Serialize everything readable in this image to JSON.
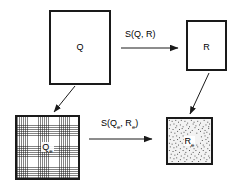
{
  "diagram": {
    "type": "commutative-square",
    "background_color": "#ffffff",
    "stroke_color": "#1a1a1a",
    "nodes": [
      {
        "id": "q",
        "label": "Q",
        "subscript": "",
        "fill": "white",
        "texture": "none",
        "position": "top-left"
      },
      {
        "id": "r",
        "label": "R",
        "subscript": "",
        "fill": "white",
        "texture": "none",
        "position": "top-right"
      },
      {
        "id": "qe",
        "label": "Q",
        "subscript": "e",
        "fill": "#ffffff",
        "texture": "fine-grid-hatch",
        "position": "bottom-left"
      },
      {
        "id": "re",
        "label": "R",
        "subscript": "e",
        "fill": "#f2f2f2",
        "texture": "stipple-noise",
        "position": "bottom-right"
      }
    ],
    "edges": [
      {
        "id": "top-arrow",
        "from": "q",
        "to": "r",
        "label": "S(Q, R)",
        "style": "horizontal-arrow"
      },
      {
        "id": "bottom-arrow",
        "from": "qe",
        "to": "re",
        "label": "S(Qe, Re)",
        "label_base_1": "S(Q",
        "label_sub_1": "e",
        "label_mid": ", R",
        "label_sub_2": "e",
        "label_end": ")",
        "style": "horizontal-arrow"
      },
      {
        "id": "left-diagonal-arrow",
        "from": "q",
        "to": "qe",
        "label": "",
        "style": "diagonal-arrow"
      },
      {
        "id": "right-diagonal-arrow",
        "from": "r",
        "to": "re",
        "label": "",
        "style": "diagonal-arrow"
      }
    ]
  }
}
